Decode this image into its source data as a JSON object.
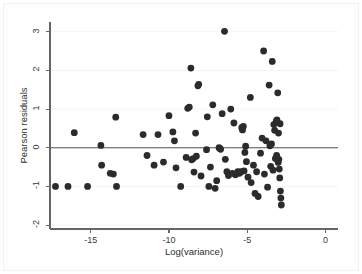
{
  "chart_data": {
    "type": "scatter",
    "title": "",
    "xlabel": "Log(variance)",
    "ylabel": "Pearson residuals",
    "xlim": [
      -17.6,
      0.8
    ],
    "ylim": [
      -2.1,
      3.25
    ],
    "xticks": [
      -15,
      -10,
      -5,
      0
    ],
    "xticklabels": [
      "-15",
      "-10",
      "-5",
      "0"
    ],
    "yticks": [
      -2,
      -1,
      0,
      1,
      2,
      3
    ],
    "yticklabels": [
      "-2",
      "-1",
      "0",
      "1",
      "2",
      "3"
    ],
    "grid": true,
    "grid_axis": "y",
    "legend": "none",
    "reference_line": {
      "axis": "y",
      "value": 0
    },
    "marker": {
      "shape": "circle",
      "color": "#2b2b2b",
      "size": 3.4
    },
    "points": [
      [
        -17.25,
        -1.0
      ],
      [
        -16.45,
        -1.0
      ],
      [
        -16.05,
        0.39
      ],
      [
        -15.2,
        -1.0
      ],
      [
        -14.35,
        0.06
      ],
      [
        -14.3,
        -0.45
      ],
      [
        -13.75,
        -0.66
      ],
      [
        -13.55,
        -0.68
      ],
      [
        -13.4,
        0.79
      ],
      [
        -13.35,
        -1.0
      ],
      [
        -11.65,
        0.34
      ],
      [
        -11.4,
        -0.2
      ],
      [
        -10.95,
        -0.45
      ],
      [
        -10.7,
        0.34
      ],
      [
        -10.35,
        -0.37
      ],
      [
        -10.0,
        0.83
      ],
      [
        -9.75,
        0.41
      ],
      [
        -9.65,
        0.18
      ],
      [
        -9.55,
        -0.52
      ],
      [
        -9.25,
        -1.0
      ],
      [
        -8.9,
        -0.25
      ],
      [
        -8.8,
        1.02
      ],
      [
        -8.7,
        1.05
      ],
      [
        -8.6,
        2.06
      ],
      [
        -8.55,
        -0.31
      ],
      [
        -8.45,
        -0.28
      ],
      [
        -8.4,
        -0.63
      ],
      [
        -8.3,
        0.38
      ],
      [
        -8.25,
        -0.22
      ],
      [
        -8.15,
        1.6
      ],
      [
        -8.1,
        1.64
      ],
      [
        -7.95,
        -0.73
      ],
      [
        -7.6,
        -0.05
      ],
      [
        -7.55,
        0.8
      ],
      [
        -7.45,
        -1.0
      ],
      [
        -7.35,
        -0.5
      ],
      [
        -7.2,
        1.11
      ],
      [
        -7.05,
        -1.05
      ],
      [
        -6.95,
        -0.85
      ],
      [
        -6.8,
        0.0
      ],
      [
        -6.75,
        -0.02
      ],
      [
        -6.7,
        -0.04
      ],
      [
        -6.6,
        0.88
      ],
      [
        -6.45,
        3.01
      ],
      [
        -6.4,
        -0.3
      ],
      [
        -6.3,
        -0.62
      ],
      [
        -6.2,
        -0.72
      ],
      [
        -6.05,
        1.0
      ],
      [
        -5.95,
        -0.66
      ],
      [
        -5.85,
        0.64
      ],
      [
        -5.75,
        -0.7
      ],
      [
        -5.6,
        -0.62
      ],
      [
        -5.5,
        -0.66
      ],
      [
        -5.45,
        -0.64
      ],
      [
        -5.4,
        -0.62
      ],
      [
        -5.35,
        0.52
      ],
      [
        -5.3,
        0.46
      ],
      [
        -5.25,
        0.55
      ],
      [
        -5.2,
        -0.6
      ],
      [
        -5.1,
        0.04
      ],
      [
        -5.05,
        -0.36
      ],
      [
        -4.95,
        -0.76
      ],
      [
        -4.8,
        1.3
      ],
      [
        -4.75,
        -0.9
      ],
      [
        -4.6,
        -0.45
      ],
      [
        -4.5,
        -1.18
      ],
      [
        -4.4,
        -0.62
      ],
      [
        -4.3,
        -1.26
      ],
      [
        -4.15,
        -0.14
      ],
      [
        -4.05,
        0.25
      ],
      [
        -3.95,
        2.5
      ],
      [
        -3.9,
        -0.68
      ],
      [
        -3.8,
        0.18
      ],
      [
        -3.7,
        -1.02
      ],
      [
        -3.6,
        1.62
      ],
      [
        -3.55,
        0.05
      ],
      [
        -3.5,
        -0.48
      ],
      [
        -3.45,
        0.1
      ],
      [
        -3.4,
        2.23
      ],
      [
        -3.35,
        -0.58
      ],
      [
        -3.3,
        0.6
      ],
      [
        -3.25,
        0.45
      ],
      [
        -3.2,
        -0.28
      ],
      [
        -3.15,
        0.68
      ],
      [
        -3.1,
        0.72
      ],
      [
        -3.05,
        1.42
      ],
      [
        -3.0,
        0.38
      ],
      [
        -2.98,
        -0.3
      ],
      [
        -2.95,
        -0.55
      ],
      [
        -2.92,
        -0.78
      ],
      [
        -2.88,
        -1.12
      ],
      [
        -2.85,
        -1.3
      ],
      [
        -2.82,
        -1.48
      ],
      [
        -3.02,
        -0.38
      ],
      [
        -3.12,
        -0.2
      ],
      [
        -2.9,
        0.62
      ],
      [
        -5.15,
        -0.12
      ]
    ]
  }
}
